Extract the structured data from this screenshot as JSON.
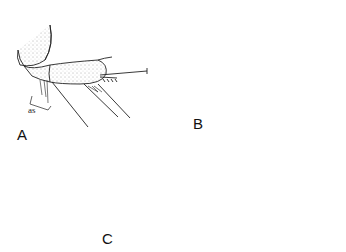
{
  "figure": {
    "panels": [
      {
        "label": "A",
        "annotation": "as"
      },
      {
        "label": "B"
      },
      {
        "label": "C"
      }
    ]
  }
}
